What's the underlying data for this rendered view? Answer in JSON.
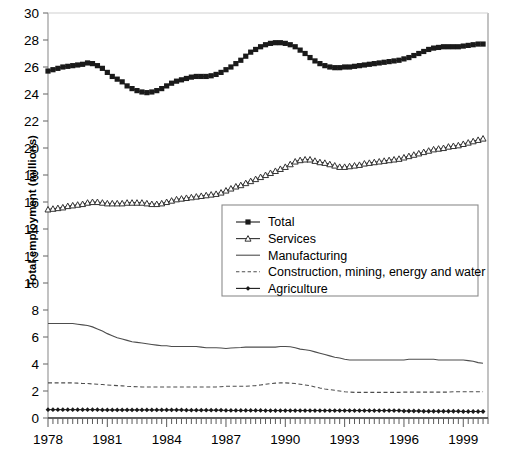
{
  "chart_data": {
    "type": "line",
    "title": "",
    "xlabel": "",
    "ylabel": "Total employment (millions)",
    "ylim": [
      0,
      30
    ],
    "ytick_step": 2,
    "yticks": [
      "0",
      "2",
      "4",
      "6",
      "8",
      "10",
      "12",
      "14",
      "16",
      "18",
      "20",
      "22",
      "24",
      "26",
      "28",
      "30"
    ],
    "xlim": [
      1978,
      2000.25
    ],
    "xticks_labeled": [
      "1978",
      "1981",
      "1984",
      "1987",
      "1990",
      "1993",
      "1996",
      "1999"
    ],
    "xtick_values": [
      1978,
      1981,
      1984,
      1987,
      1990,
      1993,
      1996,
      1999
    ],
    "minor_tick_interval_years": 0.25,
    "grid": false,
    "legend_position": "center",
    "x": [
      1978,
      1978.25,
      1978.5,
      1978.75,
      1979,
      1979.25,
      1979.5,
      1979.75,
      1980,
      1980.25,
      1980.5,
      1980.75,
      1981,
      1981.25,
      1981.5,
      1981.75,
      1982,
      1982.25,
      1982.5,
      1982.75,
      1983,
      1983.25,
      1983.5,
      1983.75,
      1984,
      1984.25,
      1984.5,
      1984.75,
      1985,
      1985.25,
      1985.5,
      1985.75,
      1986,
      1986.25,
      1986.5,
      1986.75,
      1987,
      1987.25,
      1987.5,
      1987.75,
      1988,
      1988.25,
      1988.5,
      1988.75,
      1989,
      1989.25,
      1989.5,
      1989.75,
      1990,
      1990.25,
      1990.5,
      1990.75,
      1991,
      1991.25,
      1991.5,
      1991.75,
      1992,
      1992.25,
      1992.5,
      1992.75,
      1993,
      1993.25,
      1993.5,
      1993.75,
      1994,
      1994.25,
      1994.5,
      1994.75,
      1995,
      1995.25,
      1995.5,
      1995.75,
      1996,
      1996.25,
      1996.5,
      1996.75,
      1997,
      1997.25,
      1997.5,
      1997.75,
      1998,
      1998.25,
      1998.5,
      1998.75,
      1999,
      1999.25,
      1999.5,
      1999.75,
      2000
    ],
    "series": [
      {
        "name": "Total",
        "style": "line-markers",
        "marker": "square-filled",
        "color": "#1a1a1a",
        "values": [
          25.7,
          25.8,
          25.9,
          26.0,
          26.05,
          26.1,
          26.15,
          26.2,
          26.3,
          26.25,
          26.1,
          25.9,
          25.6,
          25.3,
          25.1,
          24.9,
          24.6,
          24.4,
          24.25,
          24.15,
          24.1,
          24.15,
          24.25,
          24.4,
          24.6,
          24.8,
          24.95,
          25.05,
          25.15,
          25.25,
          25.3,
          25.3,
          25.3,
          25.35,
          25.45,
          25.6,
          25.8,
          26.0,
          26.25,
          26.5,
          26.8,
          27.1,
          27.3,
          27.5,
          27.65,
          27.75,
          27.8,
          27.8,
          27.75,
          27.65,
          27.5,
          27.25,
          27.0,
          26.7,
          26.45,
          26.25,
          26.1,
          26.0,
          25.95,
          25.95,
          26.0,
          26.0,
          26.05,
          26.1,
          26.15,
          26.2,
          26.25,
          26.3,
          26.35,
          26.4,
          26.45,
          26.5,
          26.6,
          26.7,
          26.85,
          27.0,
          27.15,
          27.3,
          27.4,
          27.45,
          27.5,
          27.5,
          27.5,
          27.5,
          27.55,
          27.6,
          27.65,
          27.7,
          27.7
        ]
      },
      {
        "name": "Services",
        "style": "line-markers",
        "marker": "triangle-open",
        "color": "#333333",
        "values": [
          15.45,
          15.5,
          15.55,
          15.6,
          15.7,
          15.75,
          15.8,
          15.85,
          15.95,
          16.0,
          16.0,
          15.95,
          15.9,
          15.9,
          15.9,
          15.9,
          15.95,
          15.95,
          15.95,
          15.95,
          15.9,
          15.85,
          15.85,
          15.9,
          16.0,
          16.1,
          16.2,
          16.25,
          16.3,
          16.35,
          16.4,
          16.45,
          16.5,
          16.55,
          16.6,
          16.7,
          16.85,
          17.0,
          17.15,
          17.25,
          17.4,
          17.55,
          17.7,
          17.85,
          18.0,
          18.15,
          18.3,
          18.45,
          18.6,
          18.8,
          19.0,
          19.1,
          19.15,
          19.15,
          19.05,
          18.95,
          18.9,
          18.8,
          18.7,
          18.6,
          18.6,
          18.65,
          18.7,
          18.75,
          18.85,
          18.9,
          18.95,
          19.0,
          19.05,
          19.1,
          19.15,
          19.2,
          19.3,
          19.4,
          19.5,
          19.6,
          19.7,
          19.8,
          19.9,
          19.95,
          20.0,
          20.1,
          20.15,
          20.2,
          20.3,
          20.4,
          20.5,
          20.6,
          20.7
        ]
      },
      {
        "name": "Manufacturing",
        "style": "line-solid",
        "marker": "none",
        "color": "#4d4d4d",
        "values": [
          7.0,
          7.0,
          7.0,
          7.0,
          7.0,
          7.0,
          6.95,
          6.9,
          6.85,
          6.75,
          6.6,
          6.45,
          6.25,
          6.1,
          5.95,
          5.85,
          5.75,
          5.65,
          5.6,
          5.55,
          5.5,
          5.45,
          5.4,
          5.35,
          5.35,
          5.3,
          5.3,
          5.3,
          5.3,
          5.3,
          5.3,
          5.25,
          5.2,
          5.2,
          5.2,
          5.18,
          5.15,
          5.18,
          5.2,
          5.22,
          5.25,
          5.25,
          5.25,
          5.25,
          5.25,
          5.25,
          5.25,
          5.3,
          5.3,
          5.28,
          5.2,
          5.1,
          5.05,
          5.0,
          4.9,
          4.8,
          4.7,
          4.6,
          4.5,
          4.45,
          4.35,
          4.3,
          4.3,
          4.3,
          4.3,
          4.3,
          4.3,
          4.3,
          4.3,
          4.3,
          4.3,
          4.3,
          4.3,
          4.35,
          4.35,
          4.35,
          4.35,
          4.35,
          4.35,
          4.3,
          4.3,
          4.3,
          4.3,
          4.3,
          4.3,
          4.25,
          4.2,
          4.1,
          4.05
        ]
      },
      {
        "name": "Construction, mining, energy and water",
        "style": "line-dashed",
        "marker": "none",
        "color": "#4d4d4d",
        "values": [
          2.6,
          2.6,
          2.6,
          2.6,
          2.6,
          2.6,
          2.58,
          2.56,
          2.55,
          2.52,
          2.5,
          2.48,
          2.45,
          2.42,
          2.4,
          2.38,
          2.35,
          2.33,
          2.32,
          2.3,
          2.3,
          2.3,
          2.3,
          2.3,
          2.3,
          2.3,
          2.3,
          2.3,
          2.3,
          2.3,
          2.3,
          2.3,
          2.3,
          2.3,
          2.3,
          2.32,
          2.35,
          2.35,
          2.35,
          2.35,
          2.35,
          2.38,
          2.4,
          2.45,
          2.5,
          2.55,
          2.58,
          2.6,
          2.6,
          2.58,
          2.55,
          2.5,
          2.45,
          2.4,
          2.3,
          2.22,
          2.15,
          2.1,
          2.05,
          2.0,
          1.95,
          1.92,
          1.9,
          1.9,
          1.9,
          1.9,
          1.9,
          1.9,
          1.9,
          1.9,
          1.9,
          1.9,
          1.92,
          1.92,
          1.92,
          1.92,
          1.92,
          1.92,
          1.92,
          1.92,
          1.92,
          1.92,
          1.95,
          1.95,
          1.95,
          1.95,
          1.95,
          1.95,
          1.95
        ]
      },
      {
        "name": "Agriculture",
        "style": "line-markers",
        "marker": "diamond-dot",
        "color": "#1a1a1a",
        "values": [
          0.62,
          0.62,
          0.62,
          0.62,
          0.62,
          0.62,
          0.62,
          0.62,
          0.62,
          0.62,
          0.62,
          0.6,
          0.6,
          0.6,
          0.6,
          0.6,
          0.6,
          0.6,
          0.6,
          0.6,
          0.6,
          0.6,
          0.6,
          0.6,
          0.6,
          0.6,
          0.6,
          0.6,
          0.58,
          0.58,
          0.58,
          0.58,
          0.58,
          0.58,
          0.58,
          0.58,
          0.56,
          0.56,
          0.56,
          0.56,
          0.56,
          0.56,
          0.56,
          0.56,
          0.55,
          0.55,
          0.55,
          0.55,
          0.55,
          0.55,
          0.55,
          0.55,
          0.55,
          0.55,
          0.55,
          0.55,
          0.55,
          0.55,
          0.55,
          0.55,
          0.55,
          0.55,
          0.55,
          0.55,
          0.55,
          0.55,
          0.55,
          0.55,
          0.55,
          0.55,
          0.55,
          0.55,
          0.52,
          0.52,
          0.52,
          0.52,
          0.5,
          0.5,
          0.5,
          0.5,
          0.5,
          0.5,
          0.5,
          0.5,
          0.48,
          0.48,
          0.48,
          0.48,
          0.48
        ]
      }
    ]
  },
  "legend": {
    "entries": [
      {
        "label": "Total"
      },
      {
        "label": "Services"
      },
      {
        "label": "Manufacturing"
      },
      {
        "label": "Construction, mining, energy and water"
      },
      {
        "label": "Agriculture"
      }
    ]
  },
  "axes": {
    "y_title": "Total employment (millions)"
  },
  "colors": {
    "axis": "#9a9a9a",
    "text": "#000000",
    "plot_line": "#4d4d4d",
    "marker": "#1a1a1a",
    "legend_border": "#8c8c8c"
  }
}
